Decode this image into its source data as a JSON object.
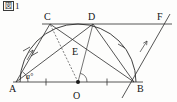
{
  "figure": {
    "caption_box": "図",
    "caption_number": "1",
    "caption_full": "図1",
    "type": "plane-geometry-diagram"
  },
  "colors": {
    "ink": "#2b2b2b",
    "dashed": "#5a5a5a",
    "background": "#fdfdfc"
  },
  "points": [
    {
      "name": "A",
      "label": "A",
      "x": 16,
      "y": 82,
      "label_x": 9,
      "label_y": 92
    },
    {
      "name": "O",
      "label": "O",
      "x": 78,
      "y": 82,
      "label_x": 74,
      "label_y": 96
    },
    {
      "name": "B",
      "label": "B",
      "x": 134,
      "y": 82,
      "label_x": 137,
      "label_y": 91
    },
    {
      "name": "C",
      "label": "C",
      "x": 50,
      "y": 24,
      "label_x": 44,
      "label_y": 20
    },
    {
      "name": "D",
      "label": "D",
      "x": 93,
      "y": 24,
      "label_x": 90,
      "label_y": 20
    },
    {
      "name": "E",
      "label": "E",
      "x": 79,
      "y": 49,
      "label_x": 75,
      "label_y": 54
    },
    {
      "name": "F",
      "label": "F",
      "x": 163,
      "y": 24,
      "label_x": 157,
      "label_y": 20
    }
  ],
  "angle_labels": [
    {
      "name": "angle-a-at-A",
      "text": "a°",
      "x": 26,
      "y": 79
    }
  ],
  "segments": [
    {
      "name": "segment-AB",
      "from": "A",
      "to": "B"
    },
    {
      "name": "segment-AC",
      "from": "A",
      "to": "C"
    },
    {
      "name": "segment-CB",
      "from": "C",
      "to": "B"
    },
    {
      "name": "segment-AD",
      "from": "A",
      "to": "D"
    },
    {
      "name": "segment-DB",
      "from": "D",
      "to": "B"
    },
    {
      "name": "segment-CD",
      "from": "C",
      "to": "D"
    },
    {
      "name": "segment-CF-line",
      "from": "C",
      "to": "F"
    },
    {
      "name": "segment-OD",
      "from": "O",
      "to": "D"
    },
    {
      "name": "segment-OC-dashed",
      "from": "O",
      "to": "C",
      "style": "dashed"
    },
    {
      "name": "line-through-B",
      "from": "B-lower",
      "to": "F-upper"
    }
  ],
  "arcs": [
    {
      "name": "semicircle-arc-AB",
      "center": "O",
      "radius": 58
    }
  ],
  "marks": [
    {
      "name": "tick-AO",
      "on": "segment-AO",
      "count": 1
    },
    {
      "name": "tick-OB",
      "on": "segment-OB",
      "count": 1
    },
    {
      "name": "tick-arc-AC",
      "on": "arc-AC",
      "count": 1
    },
    {
      "name": "tick-AC",
      "on": "segment-AC",
      "count": 1
    },
    {
      "name": "tick-arc-DB",
      "on": "arc-DB",
      "count": 1
    },
    {
      "name": "arrow-AC",
      "on": "segment-AC",
      "type": "parallel-arrow"
    },
    {
      "name": "arrow-BF",
      "on": "line-through-B",
      "type": "parallel-arrow"
    },
    {
      "name": "right-angle-at-O",
      "on": "segment-OD",
      "type": "angle-arc"
    }
  ]
}
